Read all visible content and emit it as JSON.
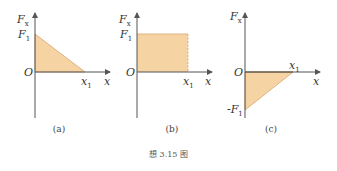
{
  "colors": {
    "fill": "#f6d3a3",
    "edge": "#d7a66e",
    "axis": "#555555"
  },
  "panels": [
    {
      "id": "a",
      "label": "(a)",
      "y_axis": "F",
      "y_sub": "x",
      "x_axis": "x",
      "origin": "O",
      "y_tick": "F",
      "y_tick_sub": "1",
      "x_tick": "x",
      "x_tick_sub": "1",
      "shape": "triangle decreasing from F1 at x=0 to 0 at x1"
    },
    {
      "id": "b",
      "label": "(b)",
      "y_axis": "F",
      "y_sub": "x",
      "x_axis": "x",
      "origin": "O",
      "y_tick": "F",
      "y_tick_sub": "1",
      "x_tick": "x",
      "x_tick_sub": "1",
      "shape": "rectangle constant F1 from 0 to x1"
    },
    {
      "id": "c",
      "label": "(c)",
      "y_axis": "F",
      "y_sub": "x",
      "x_axis": "x",
      "origin": "O",
      "y_tick": "-F",
      "y_tick_sub": "1",
      "x_tick": "x",
      "x_tick_sub": "1",
      "shape": "triangle from -F1 at x=0 rising to 0 at x1"
    }
  ],
  "caption": "想 3.15 图"
}
